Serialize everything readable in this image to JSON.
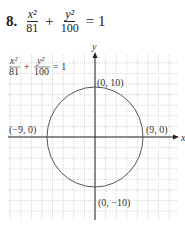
{
  "problem": {
    "number": "8.",
    "term1_num": "x²",
    "term1_den": "81",
    "plus": "+",
    "term2_num": "y²",
    "term2_den": "100",
    "equals": "= 1"
  },
  "chart_data": {
    "type": "line",
    "xlabel": "x",
    "ylabel": "y",
    "curve": "ellipse",
    "center": [
      0,
      0
    ],
    "a": 9,
    "b": 10,
    "vertices": [
      {
        "label": "(0, 10)",
        "x": 0,
        "y": 10
      },
      {
        "label": "(0, −10)",
        "x": 0,
        "y": -10
      },
      {
        "label": "(−9, 0)",
        "x": -9,
        "y": 0
      },
      {
        "label": "(9, 0)",
        "x": 9,
        "y": 0
      }
    ],
    "xlim": [
      -16,
      16
    ],
    "ylim": [
      -16,
      16
    ],
    "grid": true,
    "grid_step": 2,
    "legend_text": "x²/81 + y²/100 = 1",
    "curve_color": "#555555",
    "grid_color": "#bbbbbb"
  }
}
